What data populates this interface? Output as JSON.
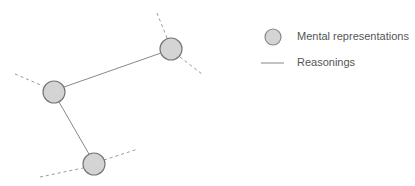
{
  "diagram": {
    "nodes": [
      {
        "id": "node-top-right",
        "cx": 171,
        "cy": 49,
        "r": 11
      },
      {
        "id": "node-left",
        "cx": 54,
        "cy": 92,
        "r": 11
      },
      {
        "id": "node-bottom",
        "cx": 94,
        "cy": 164,
        "r": 11
      }
    ],
    "edges": [
      {
        "from": "node-left",
        "to": "node-top-right",
        "style": "solid"
      },
      {
        "from": "node-left",
        "to": "node-bottom",
        "style": "solid"
      }
    ],
    "dashed_stubs": [
      {
        "x1": 157,
        "y1": 13,
        "x2": 167,
        "y2": 38
      },
      {
        "x1": 180,
        "y1": 57,
        "x2": 202,
        "y2": 74
      },
      {
        "x1": 15,
        "y1": 74,
        "x2": 43,
        "y2": 86
      },
      {
        "x1": 40,
        "y1": 177,
        "x2": 83,
        "y2": 168
      },
      {
        "x1": 104,
        "y1": 160,
        "x2": 138,
        "y2": 149
      }
    ],
    "colors": {
      "node_fill": "#d4d4d4",
      "node_stroke": "#777777",
      "edge": "#888888",
      "dashed": "#999999"
    }
  },
  "legend": {
    "items": [
      {
        "symbol": "circle",
        "label": "Mental representations"
      },
      {
        "symbol": "line",
        "label": "Reasonings"
      }
    ]
  }
}
